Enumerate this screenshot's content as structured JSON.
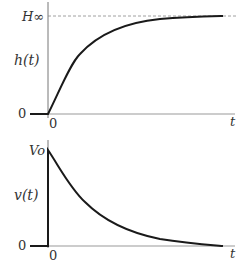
{
  "top_panel": {
    "ylabel": "h(t)",
    "xlabel": "t",
    "asymptote_label": "H∞",
    "y_zero_label": "0",
    "x_zero_label": "0",
    "curve": "rising exponential approaching H∞"
  },
  "bottom_panel": {
    "ylabel": "v(t)",
    "xlabel": "t",
    "peak_label": "Vo",
    "y_zero_label": "0",
    "x_zero_label": "0",
    "curve": "decaying exponential from Vo toward 0"
  },
  "colors": {
    "curve": "#1a1a1a",
    "axis": "#555555",
    "dashed": "#888888"
  }
}
